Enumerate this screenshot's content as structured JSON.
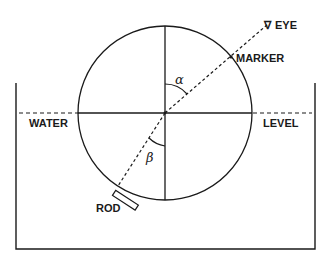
{
  "diagram": {
    "type": "refraction-apparatus",
    "labels": {
      "eye": "EYE",
      "marker": "MARKER",
      "water": "WATER",
      "level": "LEVEL",
      "rod": "ROD",
      "alpha": "α",
      "beta": "β"
    },
    "icons": {
      "eye_symbol": "∇"
    },
    "colors": {
      "stroke": "#1a1a1a",
      "background": "#ffffff"
    }
  }
}
